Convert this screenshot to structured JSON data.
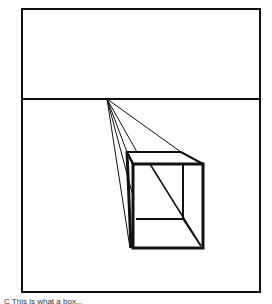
{
  "figure": {
    "type": "one-point perspective drawing",
    "caption_partial": "C This is what a box..."
  },
  "geometry": {
    "frame": {
      "x1": 22,
      "y1": 9,
      "x2": 260,
      "y2": 292
    },
    "horizon_y": 99,
    "vanishing_point": {
      "x": 107,
      "y": 99
    },
    "front_face": {
      "x1": 133,
      "y1": 164,
      "x2": 202,
      "y2": 248
    },
    "back_face": {
      "x1": 127,
      "y1": 152,
      "x2": 182,
      "y2": 219
    }
  },
  "colors": {
    "ink": "#111111",
    "paper": "#ffffff"
  }
}
